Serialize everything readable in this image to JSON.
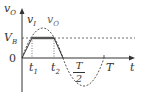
{
  "diagram": {
    "y_axis_label": {
      "main": "v",
      "sub": "O"
    },
    "x_axis_label": "t",
    "origin_label": "0",
    "level_label": {
      "main": "V",
      "sub": "B"
    },
    "curve_labels": [
      {
        "main": "v",
        "sub": "I"
      },
      {
        "main": "v",
        "sub": "O"
      }
    ],
    "tick_labels": {
      "t1": {
        "main": "t",
        "sub": "1"
      },
      "t2": {
        "main": "t",
        "sub": "2"
      },
      "half_period": {
        "numerator": "T",
        "denominator": "2"
      },
      "period": "T"
    },
    "colors": {
      "line": "#333333",
      "clipped_segment": "#555555",
      "background": "#ffffff"
    }
  }
}
